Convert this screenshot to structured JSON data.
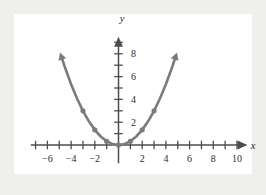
{
  "figure": {
    "background_color": "#efefed",
    "plot_background_color": "#ffffff",
    "axis_color": "#4d4d4d",
    "curve_color": "#7b7b7b"
  },
  "axes": {
    "x_name": "x",
    "y_name": "y"
  },
  "chart_data": {
    "type": "line",
    "title": "",
    "subtitle": "",
    "xlabel": "x",
    "ylabel": "y",
    "xlim": [
      -7.4,
      10.8
    ],
    "ylim": [
      -1.6,
      9.4
    ],
    "grid": false,
    "legend": null,
    "x_ticks_major": [
      -6,
      -4,
      -2,
      2,
      4,
      6,
      8,
      10
    ],
    "x_tick_labels": [
      "-6",
      "-4",
      "-2",
      "2",
      "4",
      "6",
      "8",
      "10"
    ],
    "x_ticks_minor": [
      -7,
      -5,
      -3,
      -1,
      1,
      3,
      5,
      7,
      9
    ],
    "y_ticks_major": [
      2,
      4,
      6,
      8
    ],
    "y_tick_labels": [
      "2",
      "4",
      "6",
      "8"
    ],
    "y_ticks_minor": [
      1,
      3,
      5,
      7,
      9
    ],
    "series": [
      {
        "name": "y = x^2/3",
        "equation": "y = x^2 / 3",
        "color": "#7b7b7b",
        "x": [
          -4.74,
          -4.5,
          -4,
          -3.5,
          -3,
          -2.5,
          -2,
          -1.5,
          -1,
          -0.5,
          0,
          0.5,
          1,
          1.5,
          2,
          2.5,
          3,
          3.5,
          4,
          4.5,
          4.74
        ],
        "y": [
          7.5,
          6.75,
          5.33,
          4.08,
          3,
          2.08,
          1.33,
          0.75,
          0.33,
          0.08,
          0,
          0.08,
          0.33,
          0.75,
          1.33,
          2.08,
          3,
          4.08,
          5.33,
          6.75,
          7.5
        ],
        "marker_points": [
          {
            "x": -3,
            "y": 3
          },
          {
            "x": -2,
            "y": 1.33
          },
          {
            "x": -1,
            "y": 0.33
          },
          {
            "x": 0,
            "y": 0
          },
          {
            "x": 1,
            "y": 0.33
          },
          {
            "x": 2,
            "y": 1.33
          },
          {
            "x": 3,
            "y": 3
          }
        ],
        "arrow_ends": [
          "start",
          "end"
        ]
      }
    ],
    "annotations": []
  }
}
